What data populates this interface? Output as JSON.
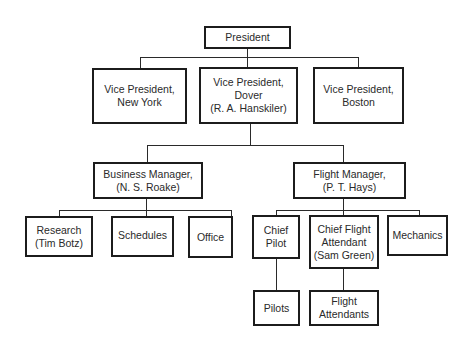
{
  "chart": {
    "type": "org-chart",
    "nodes": {
      "president": "President",
      "vp_new_york": "Vice President,\nNew York",
      "vp_dover": "Vice President,\nDover\n(R. A. Hanskiler)",
      "vp_boston": "Vice President,\nBoston",
      "business_manager": "Business Manager,\n(N. S. Roake)",
      "flight_manager": "Flight Manager,\n(P. T. Hays)",
      "research": "Research\n(Tim Botz)",
      "schedules": "Schedules",
      "office": "Office",
      "chief_pilot": "Chief\nPilot",
      "chief_flight_attendant": "Chief Flight\nAttendant\n(Sam Green)",
      "mechanics": "Mechanics",
      "pilots": "Pilots",
      "flight_attendants": "Flight\nAttendants"
    },
    "edges": [
      [
        "president",
        "vp_new_york"
      ],
      [
        "president",
        "vp_dover"
      ],
      [
        "president",
        "vp_boston"
      ],
      [
        "vp_dover",
        "business_manager"
      ],
      [
        "vp_dover",
        "flight_manager"
      ],
      [
        "business_manager",
        "research"
      ],
      [
        "business_manager",
        "schedules"
      ],
      [
        "business_manager",
        "office"
      ],
      [
        "flight_manager",
        "chief_pilot"
      ],
      [
        "flight_manager",
        "chief_flight_attendant"
      ],
      [
        "flight_manager",
        "mechanics"
      ],
      [
        "chief_pilot",
        "pilots"
      ],
      [
        "chief_flight_attendant",
        "flight_attendants"
      ]
    ]
  }
}
